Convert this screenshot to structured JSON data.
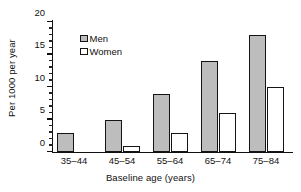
{
  "chart_data": {
    "type": "bar",
    "title": "",
    "subtitle": "",
    "xlabel": "Baseline age (years)",
    "ylabel": "Per 1000 per year",
    "categories": [
      "35–44",
      "45–54",
      "55–64",
      "65–74",
      "75–84"
    ],
    "series": [
      {
        "name": "Men",
        "values": [
          3,
          5,
          9,
          14,
          18
        ],
        "color": "#bdbdbd"
      },
      {
        "name": "Women",
        "values": [
          0,
          1,
          3,
          6,
          10
        ],
        "color": "#ffffff"
      }
    ],
    "ylim": [
      0,
      20
    ],
    "y_major_ticks": [
      0,
      5,
      10,
      15,
      20
    ],
    "y_tick_labels": [
      "0",
      "5",
      "10",
      "15",
      "20"
    ],
    "y_minor_tick_interval": 1,
    "grid": false,
    "legend_position": "upper-left-inside",
    "legend_entries": [
      "Men",
      "Women"
    ],
    "axis_color": "#111111",
    "bar_edge_color": "#141414"
  },
  "axes": {
    "y_title": "Per 1000 per year",
    "x_title": "Baseline age (years)",
    "y_ticks": [
      {
        "value": 20,
        "label": "20"
      },
      {
        "value": 15,
        "label": "15"
      },
      {
        "value": 10,
        "label": "10"
      },
      {
        "value": 5,
        "label": "5"
      },
      {
        "value": 0,
        "label": "0"
      }
    ],
    "x_categories": [
      {
        "label": "35–44"
      },
      {
        "label": "45–54"
      },
      {
        "label": "55–64"
      },
      {
        "label": "65–74"
      },
      {
        "label": "75–84"
      }
    ]
  },
  "legend": {
    "items": [
      {
        "label": "Men",
        "swatch": "filled-gray-square-icon"
      },
      {
        "label": "Women",
        "swatch": "open-white-square-icon"
      }
    ]
  }
}
